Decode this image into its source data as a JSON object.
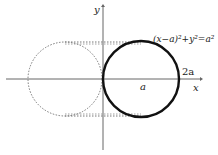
{
  "diagram": {
    "type": "geometry-plot",
    "equation_label": "(x−a)²+y²=a²",
    "axes": {
      "x_label": "x",
      "y_label": "y"
    },
    "point_labels": {
      "center": "a",
      "right_intercept": "2a"
    },
    "shapes": [
      {
        "name": "solid-circle",
        "style": "solid",
        "center": "(a, 0)",
        "radius": "a"
      },
      {
        "name": "dotted-circle",
        "style": "dotted",
        "center": "(-a, 0)",
        "radius": "a"
      }
    ],
    "connectors": [
      {
        "name": "top-dotted-tangent",
        "style": "dotted",
        "y": "a"
      },
      {
        "name": "bottom-dotted-tangent",
        "style": "dotted",
        "y": "-a"
      }
    ],
    "colors": {
      "axis": "#555555",
      "solid": "#111111",
      "dotted": "#666666"
    }
  }
}
